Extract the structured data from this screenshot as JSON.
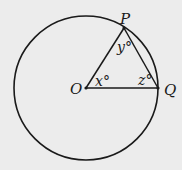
{
  "diagram": {
    "circle": {
      "cx": 86,
      "cy": 88,
      "r": 72,
      "stroke": "#1a1a1a"
    },
    "points": {
      "O": {
        "label": "O",
        "x": 86,
        "y": 88
      },
      "P": {
        "label": "P",
        "x": 124,
        "y": 28
      },
      "Q": {
        "label": "Q",
        "x": 158,
        "y": 88
      }
    },
    "angles": {
      "x": {
        "label": "x°",
        "vertex": "O"
      },
      "y": {
        "label": "y°",
        "vertex": "P"
      },
      "z": {
        "label": "z°",
        "vertex": "Q"
      }
    },
    "background": "#ececec"
  }
}
